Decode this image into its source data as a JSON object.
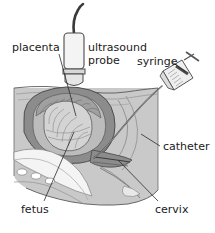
{
  "figure": {
    "background_color": "#ffffff",
    "width": 215,
    "height": 233
  },
  "palette": {
    "body_fill": "#c9c9c9",
    "body_outline": "#5a5a5a",
    "uterus_wall": "#8c8c8c",
    "uterus_wall_dark": "#6f6f6f",
    "amniotic_fill": "#b8b8b8",
    "placenta_fill": "#9a9a9a",
    "fetus_fill": "#d2d2d2",
    "bone_white": "#f4f4f4",
    "probe_fill": "#f2f2f2",
    "probe_outline": "#4a4a4a",
    "cable_dark": "#3a3a3a",
    "syringe_fill": "#eeeeee",
    "syringe_outline": "#555555",
    "syringe_plunger": "#4a4a4a",
    "catheter_line": "#4a4a4a",
    "leader_line": "#2b2b2b",
    "label_text": "#1a1a1a"
  },
  "labels": {
    "placenta": "placenta",
    "ultrasound": "ultrasound",
    "probe": "probe",
    "syringe": "syringe",
    "catheter": "catheter",
    "cervix": "cervix",
    "fetus": "fetus"
  },
  "parts": {
    "ultrasound_probe": "ultrasound-probe",
    "probe_cable": "probe-cable",
    "syringe": "syringe",
    "syringe_plunger": "syringe-plunger",
    "catheter": "catheter",
    "maternal_body": "maternal-body",
    "uterus": "uterus",
    "placenta": "placenta",
    "fetus": "fetus",
    "cervix": "cervix",
    "sacrum": "sacrum",
    "pubic_bone": "pubic-bone"
  }
}
